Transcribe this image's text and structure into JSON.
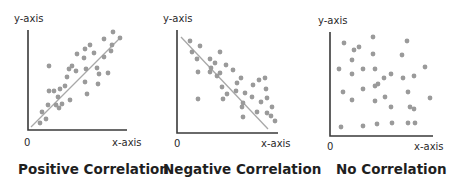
{
  "chart_data": [
    {
      "type": "scatter",
      "title": "Positive Correlation",
      "xlabel": "x-axis",
      "ylabel": "y-axis",
      "origin_label": "0",
      "grid": false,
      "trend_line": {
        "from": [
          31,
          127
        ],
        "to": [
          120,
          38
        ]
      },
      "axes": {
        "x0": 28,
        "y0": 130,
        "x1": 127,
        "ytop": 30
      },
      "points": [
        [
          40,
          123
        ],
        [
          42,
          112
        ],
        [
          46,
          119
        ],
        [
          48,
          105
        ],
        [
          49,
          91
        ],
        [
          49,
          66
        ],
        [
          54,
          91
        ],
        [
          56,
          105
        ],
        [
          58,
          97
        ],
        [
          59,
          108
        ],
        [
          60,
          89
        ],
        [
          62,
          104
        ],
        [
          65,
          86
        ],
        [
          67,
          77
        ],
        [
          69,
          69
        ],
        [
          70,
          100
        ],
        [
          72,
          66
        ],
        [
          76,
          71
        ],
        [
          77,
          54
        ],
        [
          84,
          58
        ],
        [
          85,
          49
        ],
        [
          85,
          82
        ],
        [
          86,
          69
        ],
        [
          87,
          94
        ],
        [
          90,
          45
        ],
        [
          94,
          53
        ],
        [
          97,
          68
        ],
        [
          98,
          84
        ],
        [
          99,
          74
        ],
        [
          104,
          57
        ],
        [
          104,
          39
        ],
        [
          108,
          73
        ],
        [
          111,
          51
        ],
        [
          113,
          32
        ],
        [
          112,
          45
        ],
        [
          120,
          38
        ]
      ]
    },
    {
      "type": "scatter",
      "title": "Negative Correlation",
      "xlabel": "x-axis",
      "ylabel": "y-axis",
      "origin_label": "0",
      "grid": false,
      "trend_line": {
        "from": [
          181,
          37
        ],
        "to": [
          268,
          129
        ]
      },
      "axes": {
        "x0": 177,
        "y0": 133,
        "x1": 278,
        "ytop": 30
      },
      "points": [
        [
          190,
          41
        ],
        [
          192,
          52
        ],
        [
          197,
          59
        ],
        [
          198,
          72
        ],
        [
          198,
          99
        ],
        [
          200,
          46
        ],
        [
          210,
          59
        ],
        [
          210,
          72
        ],
        [
          211,
          68
        ],
        [
          215,
          63
        ],
        [
          217,
          76
        ],
        [
          220,
          52
        ],
        [
          220,
          73
        ],
        [
          222,
          87
        ],
        [
          223,
          99
        ],
        [
          226,
          65
        ],
        [
          227,
          94
        ],
        [
          233,
          70
        ],
        [
          236,
          91
        ],
        [
          237,
          83
        ],
        [
          241,
          78
        ],
        [
          242,
          107
        ],
        [
          243,
          103
        ],
        [
          243,
          117
        ],
        [
          245,
          93
        ],
        [
          252,
          97
        ],
        [
          253,
          85
        ],
        [
          257,
          112
        ],
        [
          259,
          80
        ],
        [
          261,
          102
        ],
        [
          265,
          78
        ],
        [
          266,
          89
        ],
        [
          267,
          113
        ],
        [
          267,
          98
        ],
        [
          271,
          116
        ],
        [
          272,
          107
        ],
        [
          275,
          121
        ]
      ]
    },
    {
      "type": "scatter",
      "title": "No Correlation",
      "xlabel": "x-axis",
      "ylabel": "y-axis",
      "origin_label": "0",
      "grid": false,
      "axes": {
        "x0": 330,
        "y0": 136,
        "x1": 433,
        "ytop": 32
      },
      "points": [
        [
          339,
          69
        ],
        [
          341,
          127
        ],
        [
          343,
          92
        ],
        [
          344,
          43
        ],
        [
          352,
          60
        ],
        [
          352,
          74
        ],
        [
          352,
          100
        ],
        [
          354,
          50
        ],
        [
          359,
          47
        ],
        [
          363,
          69
        ],
        [
          363,
          89
        ],
        [
          363,
          126
        ],
        [
          373,
          37
        ],
        [
          373,
          54
        ],
        [
          375,
          69
        ],
        [
          375,
          86
        ],
        [
          375,
          101
        ],
        [
          377,
          124
        ],
        [
          378,
          84
        ],
        [
          384,
          78
        ],
        [
          385,
          97
        ],
        [
          391,
          74
        ],
        [
          391,
          107
        ],
        [
          392,
          123
        ],
        [
          402,
          55
        ],
        [
          403,
          78
        ],
        [
          408,
          123
        ],
        [
          407,
          41
        ],
        [
          408,
          92
        ],
        [
          410,
          107
        ],
        [
          414,
          109
        ],
        [
          414,
          76
        ],
        [
          415,
          123
        ],
        [
          425,
          67
        ],
        [
          430,
          98
        ]
      ]
    }
  ],
  "labels": {
    "p1": {
      "y": "y-axis",
      "x": "x-axis",
      "zero": "0",
      "title": "Positive Correlation"
    },
    "p2": {
      "y": "y-axis",
      "x": "x-axis",
      "zero": "0",
      "title": "Negative Correlation"
    },
    "p3": {
      "y": "y-axis",
      "x": "x-axis",
      "zero": "0",
      "title": "No Correlation"
    }
  },
  "colors": {
    "point": "#9a9a9a",
    "axis": "#3a3a3a",
    "trend": "#a8a8a8",
    "text": "#222222"
  }
}
